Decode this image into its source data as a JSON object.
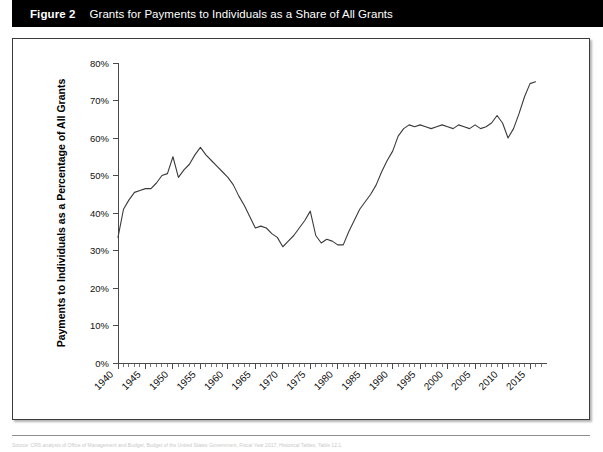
{
  "header": {
    "figure_label": "Figure 2",
    "title": "Grants for Payments to Individuals as a Share of All Grants",
    "background_color": "#000000",
    "text_color": "#ffffff"
  },
  "source_note": "Source: CRS analysis of Office of Management and Budget, Budget of the United States Government, Fiscal Year 2017, Historical Tables, Table 12.1.",
  "chart_data": {
    "type": "line",
    "title": "Grants for Payments to Individuals as a Share of All Grants",
    "xlabel": "",
    "ylabel": "Payments to Individuals as a Percentage of All Grants",
    "xlim": [
      1940,
      2017
    ],
    "ylim": [
      0,
      80
    ],
    "y_tick_labels": [
      "0%",
      "10%",
      "20%",
      "30%",
      "40%",
      "50%",
      "60%",
      "70%",
      "80%"
    ],
    "y_tick_values": [
      0,
      10,
      20,
      30,
      40,
      50,
      60,
      70,
      80
    ],
    "x_tick_labels": [
      "1940",
      "1945",
      "1950",
      "1955",
      "1960",
      "1965",
      "1970",
      "1975",
      "1980",
      "1985",
      "1990",
      "1995",
      "2000",
      "2005",
      "2010",
      "2015"
    ],
    "x_tick_values": [
      1940,
      1945,
      1950,
      1955,
      1960,
      1965,
      1970,
      1975,
      1980,
      1985,
      1990,
      1995,
      2000,
      2005,
      2010,
      2015
    ],
    "x_minor_tick_interval": 1,
    "grid": false,
    "legend": false,
    "line_color": "#3a3a3a",
    "series": [
      {
        "name": "Payments to Individuals as a Percentage of All Grants",
        "x": [
          1940,
          1941,
          1942,
          1943,
          1944,
          1945,
          1946,
          1947,
          1948,
          1949,
          1950,
          1951,
          1952,
          1953,
          1954,
          1955,
          1956,
          1957,
          1958,
          1959,
          1960,
          1961,
          1962,
          1963,
          1964,
          1965,
          1966,
          1967,
          1968,
          1969,
          1970,
          1971,
          1972,
          1973,
          1974,
          1975,
          1976,
          1977,
          1978,
          1979,
          1980,
          1981,
          1982,
          1983,
          1984,
          1985,
          1986,
          1987,
          1988,
          1989,
          1990,
          1991,
          1992,
          1993,
          1994,
          1995,
          1996,
          1997,
          1998,
          1999,
          2000,
          2001,
          2002,
          2003,
          2004,
          2005,
          2006,
          2007,
          2008,
          2009,
          2010,
          2011,
          2012,
          2013,
          2014,
          2015,
          2016
        ],
        "values": [
          33.5,
          41.0,
          43.5,
          45.5,
          46.0,
          46.5,
          46.5,
          48.0,
          50.0,
          50.5,
          55.0,
          49.5,
          51.5,
          53.0,
          55.5,
          57.5,
          55.5,
          54.0,
          52.5,
          51.0,
          49.5,
          47.5,
          44.5,
          42.0,
          39.0,
          36.0,
          36.5,
          36.0,
          34.5,
          33.5,
          31.0,
          32.5,
          34.0,
          36.0,
          38.0,
          40.5,
          34.0,
          32.0,
          33.0,
          32.5,
          31.5,
          31.5,
          35.0,
          38.0,
          41.0,
          43.0,
          45.0,
          47.5,
          51.0,
          54.0,
          56.5,
          60.5,
          62.5,
          63.5,
          63.0,
          63.5,
          63.0,
          62.5,
          63.0,
          63.5,
          63.0,
          62.5,
          63.5,
          63.0,
          62.5,
          63.5,
          62.5,
          63.0,
          64.0,
          66.0,
          64.0,
          60.0,
          62.5,
          66.5,
          71.0,
          74.5,
          75.0
        ]
      }
    ]
  }
}
